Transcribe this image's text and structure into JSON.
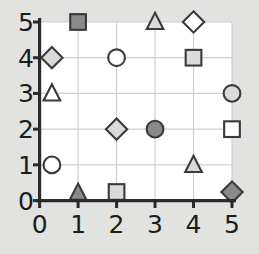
{
  "chart_data": {
    "type": "scatter",
    "title": "",
    "xlabel": "",
    "ylabel": "",
    "xlim": [
      0,
      5.35
    ],
    "ylim": [
      0,
      5.2
    ],
    "grid": true,
    "legend": null,
    "x_ticks": [
      "0",
      "1",
      "2",
      "3",
      "4",
      "5"
    ],
    "y_ticks": [
      "0",
      "1",
      "2",
      "3",
      "4",
      "5"
    ],
    "x_tick_values": [
      0,
      1,
      2,
      3,
      4,
      5
    ],
    "y_tick_values": [
      0,
      1,
      2,
      3,
      4,
      5
    ],
    "marker_shapes": [
      "circle",
      "square",
      "triangle",
      "diamond"
    ],
    "fill_shades": {
      "white": "#ffffff",
      "light_gray": "#dadada",
      "dark_gray": "#8a8a8a"
    },
    "marker_edge_color": "#3a3a3a",
    "background_color": "#e2e2e0",
    "plot_background_color": "#ffffff",
    "gridline_color": "#cfcfcf",
    "axis_color": "#2b2b2b",
    "points": [
      {
        "x": 1,
        "y": 5,
        "shape": "square",
        "fill": "dark_gray"
      },
      {
        "x": 3,
        "y": 5,
        "shape": "triangle",
        "fill": "light_gray"
      },
      {
        "x": 4,
        "y": 5,
        "shape": "diamond",
        "fill": "white"
      },
      {
        "x": 0.32,
        "y": 4,
        "shape": "diamond",
        "fill": "light_gray"
      },
      {
        "x": 2,
        "y": 4,
        "shape": "circle",
        "fill": "white"
      },
      {
        "x": 4,
        "y": 4,
        "shape": "square",
        "fill": "light_gray"
      },
      {
        "x": 0.32,
        "y": 3,
        "shape": "triangle",
        "fill": "white"
      },
      {
        "x": 5,
        "y": 3,
        "shape": "circle",
        "fill": "light_gray"
      },
      {
        "x": 2,
        "y": 2,
        "shape": "diamond",
        "fill": "light_gray"
      },
      {
        "x": 3,
        "y": 2,
        "shape": "circle",
        "fill": "dark_gray"
      },
      {
        "x": 5,
        "y": 2,
        "shape": "square",
        "fill": "white"
      },
      {
        "x": 0.32,
        "y": 1,
        "shape": "circle",
        "fill": "white"
      },
      {
        "x": 4,
        "y": 1,
        "shape": "triangle",
        "fill": "light_gray"
      },
      {
        "x": 1,
        "y": 0.22,
        "shape": "triangle",
        "fill": "dark_gray"
      },
      {
        "x": 2,
        "y": 0.24,
        "shape": "square",
        "fill": "light_gray"
      },
      {
        "x": 5,
        "y": 0.24,
        "shape": "diamond",
        "fill": "dark_gray"
      }
    ]
  }
}
